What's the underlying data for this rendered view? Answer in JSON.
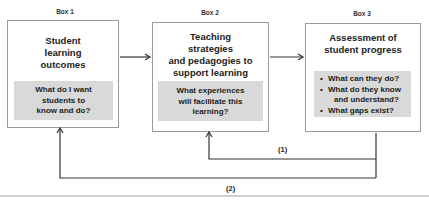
{
  "boxes": [
    {
      "label": "Box 1",
      "title_lines": [
        "Student",
        "learning",
        "outcomes"
      ],
      "question_lines": [
        "What do I want",
        "students to",
        "know and do?"
      ]
    },
    {
      "label": "Box 2",
      "title_lines": [
        "Teaching",
        "strategies",
        "and pedagogies to",
        "support learning"
      ],
      "question_lines": [
        "What experiences",
        "will facilitate this",
        "learning?"
      ]
    },
    {
      "label": "Box 3",
      "title_lines": [
        "Assessment of",
        "student progress"
      ],
      "bullets": [
        "What can they do?",
        "What do they know",
        "and understand?",
        "What gaps exist?"
      ]
    }
  ],
  "feedback_loops": [
    {
      "label": "(1)",
      "from": "Box 3",
      "to": "Box 2"
    },
    {
      "label": "(2)",
      "from": "Box 3",
      "to": "Box 1"
    }
  ],
  "colors": {
    "box_border": "#9a9a9a",
    "question_fill": "#d9d9d9",
    "arrow": "#333333",
    "rule": "#a0a0a0"
  }
}
